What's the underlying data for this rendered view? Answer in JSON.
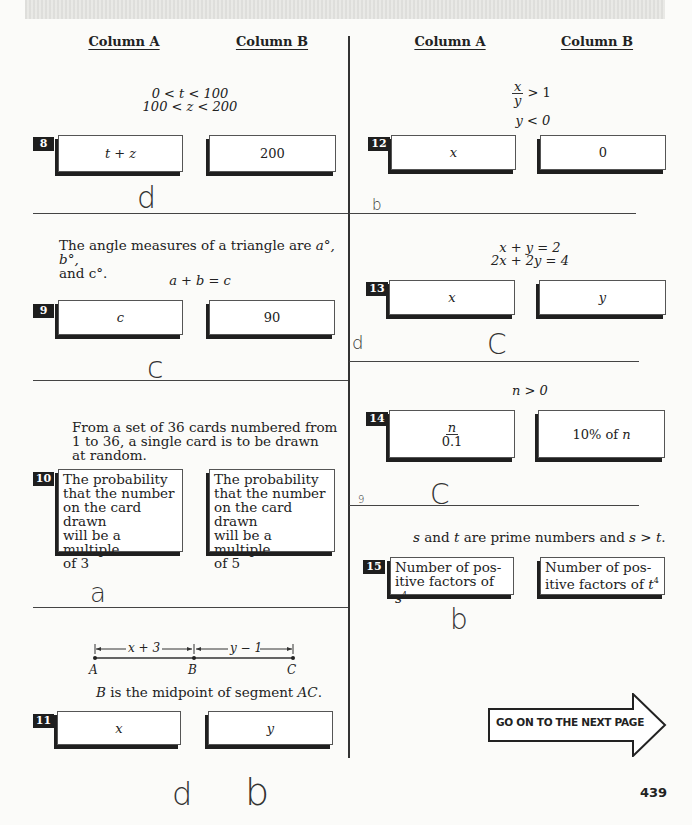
{
  "header": {
    "left": {
      "column_a": "Column A",
      "column_b": "Column B"
    },
    "right": {
      "column_a": "Column A",
      "column_b": "Column B"
    }
  },
  "questions": [
    {
      "number": "8",
      "given": [
        "0 < t < 100",
        "100 < z < 200"
      ],
      "column_a": "t + z",
      "column_b": "200",
      "handwritten_answer": "d"
    },
    {
      "number": "9",
      "given_text": "The angle measures of a triangle are a°, b°, and c°.",
      "given_text_line1": "The angle measures of a triangle are",
      "given_text_vars": "a°,  b°,",
      "given_text_line2": "and  c°.",
      "given": [
        "a + b = c"
      ],
      "column_a": "c",
      "column_b": "90",
      "handwritten_answer": "c"
    },
    {
      "number": "10",
      "given_lines": [
        "From a set of 36 cards numbered from",
        "1 to 36, a single card is to be drawn",
        "at random."
      ],
      "column_a_lines": [
        "The probability",
        "that the number",
        "on the card drawn",
        "will be a multiple",
        "of 3"
      ],
      "column_b_lines": [
        "The probability",
        "that  the number",
        "on the card drawn",
        "will be a multiple",
        "of 5"
      ],
      "handwritten_answer": "a"
    },
    {
      "number": "11",
      "diagram": {
        "points": [
          "A",
          "B",
          "C"
        ],
        "segment_ab_label": "x + 3",
        "segment_bc_label": "y − 1"
      },
      "given_text_pre": "B",
      "given_text_mid": " is the midpoint of segment ",
      "given_text_post": "AC",
      "given_text_end": ".",
      "column_a": "x",
      "column_b": "y",
      "handwritten_answer": "d",
      "handwritten_extra": "b"
    },
    {
      "number": "12",
      "given_fraction": {
        "num": "x",
        "den": "y",
        "rel": "> 1"
      },
      "given": [
        "y < 0"
      ],
      "column_a": "x",
      "column_b": "0",
      "handwritten_answer": "b"
    },
    {
      "number": "13",
      "given": [
        "x + y = 2",
        "2x + 2y = 4"
      ],
      "column_a": "x",
      "column_b": "y",
      "handwritten_answer": "C",
      "handwritten_side": "d"
    },
    {
      "number": "14",
      "given": [
        "n > 0"
      ],
      "column_a_fraction": {
        "num": "n",
        "den": "0.1"
      },
      "column_b_pre": "10% of ",
      "column_b_var": "n",
      "handwritten_answer": "C",
      "handwritten_side": "9"
    },
    {
      "number": "15",
      "given_parts": [
        "s",
        " and ",
        "t",
        " are prime numbers and ",
        "s > t",
        "."
      ],
      "column_a_lines": [
        "Number of pos-",
        "itive factors of "
      ],
      "column_a_var": "s",
      "column_b_lines": [
        "Number of pos-",
        "itive factors of "
      ],
      "column_b_var": "t",
      "exponent": "4",
      "handwritten_answer": "b"
    }
  ],
  "footer": {
    "next_page_label": "GO ON TO THE NEXT PAGE",
    "page_number": "439"
  }
}
